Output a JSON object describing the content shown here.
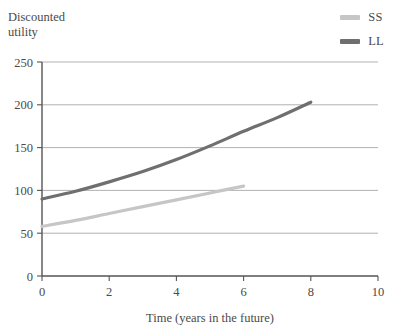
{
  "chart_data": {
    "type": "line",
    "title": "",
    "ylabel": "Discounted\nutility",
    "xlabel": "Time (years in the future)",
    "xlim": [
      0,
      10
    ],
    "ylim": [
      0,
      250
    ],
    "xticks": [
      "0",
      "2",
      "4",
      "6",
      "8",
      "10"
    ],
    "xtick_values": [
      0,
      2,
      4,
      6,
      8,
      10
    ],
    "yticks": [
      "0",
      "50",
      "100",
      "150",
      "200",
      "250"
    ],
    "ytick_values": [
      0,
      50,
      100,
      150,
      200,
      250
    ],
    "grid": "horizontal",
    "legend_position": "top-right",
    "series": [
      {
        "name": "SS",
        "color": "#c6c6c6",
        "x": [
          0,
          1,
          2,
          3,
          4,
          5,
          6
        ],
        "values": [
          58,
          65,
          73,
          81,
          89,
          97,
          105
        ]
      },
      {
        "name": "LL",
        "color": "#6f6f6f",
        "x": [
          0,
          1,
          2,
          3,
          4,
          5,
          6,
          7,
          8
        ],
        "values": [
          90,
          99,
          110,
          122,
          136,
          152,
          169,
          185,
          203
        ]
      }
    ]
  },
  "legend": {
    "items": [
      {
        "label": "SS",
        "color": "#c6c6c6"
      },
      {
        "label": "LL",
        "color": "#6f6f6f"
      }
    ]
  },
  "axes": {
    "y_axis_label": "Discounted\nutility",
    "x_axis_label": "Time (years in the future)"
  }
}
